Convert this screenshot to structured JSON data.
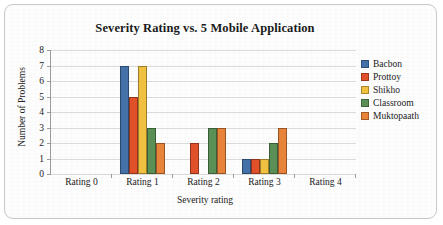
{
  "chart_data": {
    "type": "bar",
    "title": "Severity Rating vs. 5 Mobile Application",
    "xlabel": "Severity rating",
    "ylabel": "Number of Problems",
    "categories": [
      "Rating 0",
      "Rating 1",
      "Rating 2",
      "Rating 3",
      "Rating 4"
    ],
    "ylim": [
      0,
      8
    ],
    "yticks": [
      0,
      1,
      2,
      3,
      4,
      5,
      6,
      7,
      8
    ],
    "grid": true,
    "legend_position": "right",
    "series": [
      {
        "name": "Bacbon",
        "color": "#4472a8",
        "values": [
          0,
          7,
          0,
          1,
          0
        ]
      },
      {
        "name": "Prottoy",
        "color": "#e0512a",
        "values": [
          0,
          5,
          2,
          1,
          0
        ]
      },
      {
        "name": "Shikho",
        "color": "#f0c040",
        "values": [
          0,
          7,
          0,
          1,
          0
        ]
      },
      {
        "name": "Classroom",
        "color": "#5a9055",
        "values": [
          0,
          3,
          3,
          2,
          0
        ]
      },
      {
        "name": "Muktopaath",
        "color": "#e8833a",
        "values": [
          0,
          2,
          3,
          3,
          0
        ]
      }
    ]
  }
}
